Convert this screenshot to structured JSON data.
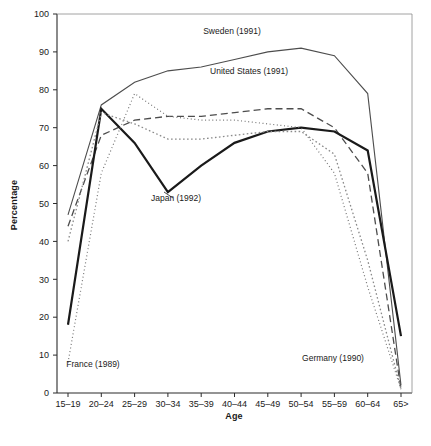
{
  "chart_data": {
    "type": "line",
    "title": "",
    "xlabel": "Age",
    "ylabel": "Percentage",
    "categories": [
      "15-19",
      "20-24",
      "25-29",
      "30-34",
      "35-39",
      "40-44",
      "45-49",
      "50-54",
      "55-59",
      "60-64",
      "65>"
    ],
    "xtick_labels": [
      "15–19",
      "20–24",
      "25–29",
      "30–34",
      "35–39",
      "40–44",
      "45–49",
      "50–54",
      "55–59",
      "60–64",
      "65>"
    ],
    "ytick_labels": [
      "0",
      "10",
      "20",
      "30",
      "40",
      "50",
      "60",
      "70",
      "80",
      "90",
      "100"
    ],
    "ylim": [
      0,
      100
    ],
    "ytick_values": [
      0,
      10,
      20,
      30,
      40,
      50,
      60,
      70,
      80,
      90,
      100
    ],
    "grid": false,
    "legend_position": "inline-annotations",
    "series": [
      {
        "name": "Sweden (1991)",
        "label": "Sweden (1991)",
        "style": "solid-thin",
        "color": "#4d4d4d",
        "values": [
          47,
          76,
          82,
          85,
          86,
          88,
          90,
          91,
          89,
          79,
          2
        ]
      },
      {
        "name": "United States (1991)",
        "label": "United States (1991)",
        "style": "dashed",
        "color": "#4d4d4d",
        "values": [
          44,
          68,
          72,
          73,
          73,
          74,
          75,
          75,
          70,
          58,
          1
        ]
      },
      {
        "name": "Japan (1992)",
        "label": "Japan (1992)",
        "style": "solid-thick",
        "color": "#1a1a1a",
        "values": [
          18,
          75,
          66,
          53,
          60,
          66,
          69,
          70,
          69,
          64,
          15
        ]
      },
      {
        "name": "France (1989)",
        "label": "France (1989)",
        "style": "dotted-fine",
        "color": "#777777",
        "values": [
          8,
          58,
          79,
          73,
          72,
          72,
          71,
          70,
          58,
          28,
          1
        ]
      },
      {
        "name": "Germany (1990)",
        "label": "Germany (1990)",
        "style": "dotted",
        "color": "#8a8a8a",
        "values": [
          40,
          74,
          71,
          67,
          67,
          68,
          69,
          69,
          63,
          35,
          1
        ]
      }
    ],
    "annotations": [
      {
        "text": "Sweden (1991)",
        "x_px": 232,
        "y_px": 34
      },
      {
        "text": "United States (1991)",
        "x_px": 249,
        "y_px": 74
      },
      {
        "text": "Japan (1992)",
        "x_px": 176,
        "y_px": 201
      },
      {
        "text": "France (1989)",
        "x_px": 93,
        "y_px": 367
      },
      {
        "text": "Germany (1990)",
        "x_px": 333,
        "y_px": 361
      }
    ]
  },
  "axes": {
    "x_axis_label": "Age",
    "y_axis_label": "Percentage"
  }
}
